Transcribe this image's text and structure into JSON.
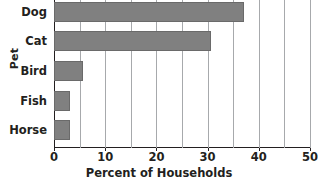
{
  "chart_data": {
    "type": "bar",
    "orientation": "horizontal",
    "title": "",
    "xlabel": "Percent of Households",
    "ylabel": "Pet",
    "categories": [
      "Dog",
      "Cat",
      "Bird",
      "Fish",
      "Horse"
    ],
    "values": [
      37.2,
      30.6,
      5.7,
      3.1,
      3.1
    ],
    "xlim": [
      0,
      50
    ],
    "xticks": [
      0,
      10,
      20,
      30,
      40,
      50
    ],
    "xticklabels": [
      "0",
      "10",
      "20",
      "30",
      "40",
      "50"
    ],
    "gridlines": [
      0,
      5,
      10,
      15,
      20,
      25,
      30,
      35,
      40,
      45,
      50
    ],
    "grid": true,
    "grid_axis": "x",
    "legend": "none",
    "bar_color": "#808080",
    "text_color": "#231f20",
    "grid_color": "#a7a9ac",
    "background": "#ffffff"
  }
}
